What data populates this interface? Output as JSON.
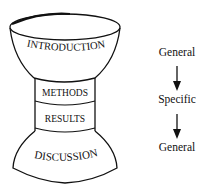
{
  "diagram": {
    "type": "hourglass-structure",
    "sections": [
      {
        "label": "INTRODUCTION",
        "shape": "inverted-bowl-top"
      },
      {
        "label": "METHODS",
        "shape": "narrow-band"
      },
      {
        "label": "RESULTS",
        "shape": "narrow-band"
      },
      {
        "label": "DISCUSSION",
        "shape": "flared-base"
      }
    ],
    "flow": {
      "steps": [
        "General",
        "Specific",
        "General"
      ],
      "arrows": [
        "down-arrow",
        "down-arrow"
      ]
    },
    "colors": {
      "stroke": "#111111",
      "background": "#ffffff"
    }
  }
}
